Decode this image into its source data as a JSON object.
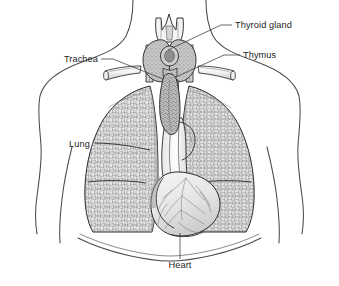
{
  "figure": {
    "background_color": "#ffffff",
    "line_color": "#2b2b2b",
    "outline_color": "#4a4a4a",
    "text_color": "#1d1d1d",
    "leader_color": "#3a3a3a"
  },
  "labels": [
    {
      "id": "thyroid-gland",
      "text": "Thyroid gland",
      "text_x": 235,
      "text_y": 28,
      "anchor": "start",
      "leader": "M 232,25 L 221,25 L 168,50",
      "side": "right"
    },
    {
      "id": "thymus",
      "text": "Thymus",
      "text_x": 243,
      "text_y": 58,
      "anchor": "start",
      "leader": "M 240,55 L 224,55 L 176,77",
      "side": "right"
    },
    {
      "id": "trachea",
      "text": "Trachea",
      "text_x": 98,
      "text_y": 62,
      "anchor": "end",
      "leader": "M 101,59 L 113,59 L 163,79",
      "side": "left"
    },
    {
      "id": "lung",
      "text": "Lung",
      "text_x": 69,
      "text_y": 147,
      "anchor": "start",
      "leader": "",
      "side": "left"
    },
    {
      "id": "heart",
      "text": "Heart",
      "text_x": 180,
      "text_y": 268,
      "anchor": "middle",
      "leader": "M 180,259 L 180,233",
      "side": "bottom"
    }
  ],
  "structures": [
    {
      "id": "body-outline",
      "name": "torso-and-neck-outline"
    },
    {
      "id": "larynx",
      "name": "larynx-thyroid-cartilage"
    },
    {
      "id": "thyroid-gland-shape",
      "name": "thyroid-gland"
    },
    {
      "id": "trachea-shape",
      "name": "trachea"
    },
    {
      "id": "clavicle-left",
      "name": "left-clavicle"
    },
    {
      "id": "clavicle-right",
      "name": "right-clavicle"
    },
    {
      "id": "lung-left",
      "name": "left-lung"
    },
    {
      "id": "lung-right",
      "name": "right-lung"
    },
    {
      "id": "thymus-shape",
      "name": "thymus"
    },
    {
      "id": "heart-shape",
      "name": "heart"
    },
    {
      "id": "diaphragm",
      "name": "diaphragm"
    }
  ]
}
